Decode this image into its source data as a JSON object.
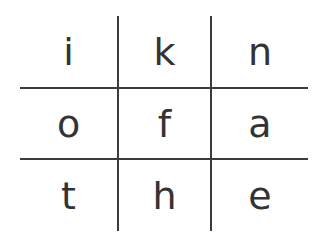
{
  "grid": {
    "line_color": "#3b3b3b",
    "letter_color": "#333333",
    "rows": [
      [
        "i",
        "k",
        "n"
      ],
      [
        "o",
        "f",
        "a"
      ],
      [
        "t",
        "h",
        "e"
      ]
    ]
  }
}
